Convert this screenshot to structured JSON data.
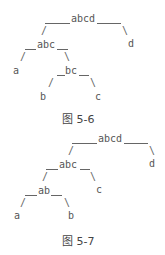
{
  "figure1": {
    "caption": "图 5-6",
    "nodes": {
      "abcd": "abcd",
      "abc": "abc",
      "d": "d",
      "a": "a",
      "bc": "bc",
      "b": "b",
      "c": "c"
    }
  },
  "figure2": {
    "caption": "图 5-7",
    "nodes": {
      "abcd": "abcd",
      "abc": "abc",
      "d": "d",
      "ab": "ab",
      "c": "c",
      "a": "a",
      "b": "b"
    }
  },
  "edges": {
    "left": "/",
    "right": "\\"
  }
}
